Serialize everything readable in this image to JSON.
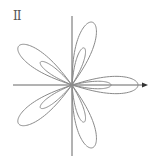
{
  "panel_label": "II",
  "colors": {
    "axis": "#666666",
    "curve": "#8a8a8a",
    "background": "#ffffff"
  },
  "chart_data": {
    "type": "line",
    "title": "II",
    "petals": 5,
    "petal_angles_deg": [
      0,
      72,
      144,
      216,
      288
    ],
    "outer_petal_radius_px": 66,
    "inner_loop_radius_px": 39,
    "origin_px": [
      72,
      85
    ],
    "axes": {
      "x_axis": {
        "from_px": 13,
        "to_px": 148,
        "arrow": true
      },
      "y_axis": {
        "from_px": 16,
        "to_px": 156,
        "arrow": false
      }
    },
    "xlabel": "",
    "ylabel": "",
    "grid": false
  }
}
